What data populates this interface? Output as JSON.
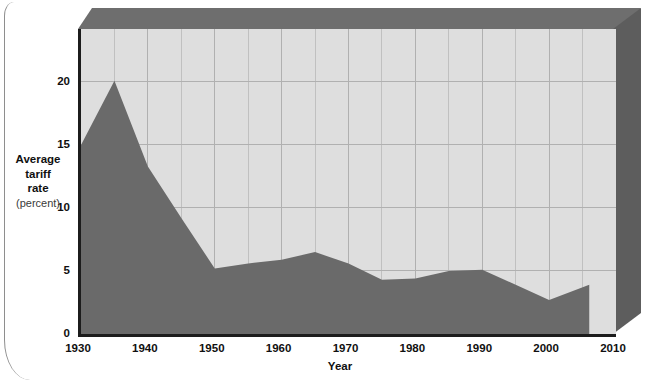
{
  "chart_data": {
    "type": "area",
    "title": "",
    "xlabel": "Year",
    "ylabel": "Average tariff rate (percent)",
    "ylabel_lines": [
      "Average",
      "tariff",
      "rate"
    ],
    "ylabel_unit": "(percent)",
    "xlim": [
      1930,
      2010
    ],
    "ylim": [
      0,
      24.2
    ],
    "grid": true,
    "grid_x_major_step": 10,
    "grid_x_minor_step": 5,
    "grid_y_step": 5,
    "legend": "none",
    "xticks": [
      1930,
      1940,
      1950,
      1960,
      1970,
      1980,
      1990,
      2000,
      2010
    ],
    "xtick_labels": [
      "1930",
      "1940",
      "1950",
      "1960",
      "1970",
      "1980",
      "1990",
      "2000",
      "2010"
    ],
    "yticks": [
      0,
      5,
      10,
      15,
      20
    ],
    "ytick_labels": [
      "0",
      "5",
      "10",
      "15",
      "20"
    ],
    "series": [
      {
        "name": "Average tariff rate",
        "x": [
          1930,
          1935,
          1940,
          1945,
          1950,
          1955,
          1960,
          1965,
          1970,
          1975,
          1980,
          1985,
          1990,
          1995,
          2000,
          2006
        ],
        "values": [
          15.0,
          20.1,
          13.3,
          9.2,
          5.2,
          5.6,
          5.9,
          6.5,
          5.6,
          4.3,
          4.4,
          5.0,
          5.1,
          3.9,
          2.7,
          3.9
        ]
      }
    ],
    "colors": {
      "area_fill": "#6a6a6a",
      "plot_background": "#dedede",
      "gridline": "#c0c0c0",
      "gridline_major": "#b0b0b0",
      "axis": "#1c1c1c",
      "bevel_top": "#6e6e6e",
      "bevel_right": "#5d5d5d",
      "text": "#101010"
    }
  }
}
